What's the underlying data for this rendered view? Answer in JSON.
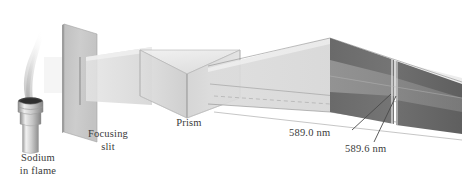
{
  "figure": {
    "type": "prism-spectroscopy-diagram",
    "background_color": "#ffffff"
  },
  "labels": {
    "source_line1": "Sodium",
    "source_line2": "in flame",
    "slit_line1": "Focusing",
    "slit_line2": "slit",
    "prism": "Prism",
    "line_a": "589.0 nm",
    "line_b": "589.6 nm"
  },
  "colors": {
    "ink": "#3a3a3a",
    "outline": "#6e6e6e",
    "beam": "#dcdcdc",
    "beam_light": "#e8e8e8",
    "plate_face": "#c9c9c9",
    "plate_edge": "#a8a8a8",
    "prism_face": "#d4d4d4",
    "prism_top": "#e6e6e6",
    "screen_dark": "#6b6b6b",
    "screen_mid": "#8f8f8f",
    "flame": "#d8d8d8",
    "burner_metal": "#bdbdbd",
    "burner_dark": "#4a4a4a"
  },
  "components": {
    "source": "bunsen-burner-with-flame",
    "slit": "focusing-slit-plate",
    "disperser": "triangular-prism",
    "detector": "projection-screen"
  },
  "spectral_lines": [
    {
      "label": "589.0 nm",
      "wavelength_nm": 589.0
    },
    {
      "label": "589.6 nm",
      "wavelength_nm": 589.6
    }
  ]
}
